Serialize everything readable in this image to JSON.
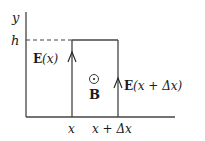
{
  "diagram": {
    "axis_labels": {
      "y": "y",
      "h": "h"
    },
    "field_labels": {
      "left_bold": "E",
      "left_arg": "(x)",
      "right_bold": "E",
      "right_arg": "(x + Δx)"
    },
    "magnetic_field": {
      "symbol": "⊙",
      "label": "B"
    },
    "x_ticks": {
      "left": "x",
      "right": "x + Δx"
    }
  }
}
